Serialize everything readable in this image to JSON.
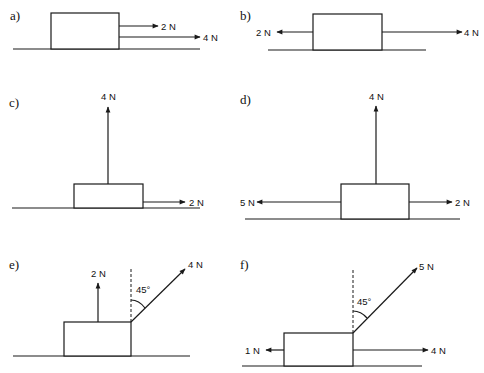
{
  "figure": {
    "panels": [
      {
        "label": "a)",
        "forces": [
          {
            "magnitude": "2 N",
            "direction": "right"
          },
          {
            "magnitude": "4 N",
            "direction": "right"
          }
        ]
      },
      {
        "label": "b)",
        "forces": [
          {
            "magnitude": "2 N",
            "direction": "left"
          },
          {
            "magnitude": "4 N",
            "direction": "right"
          }
        ]
      },
      {
        "label": "c)",
        "forces": [
          {
            "magnitude": "4 N",
            "direction": "up"
          },
          {
            "magnitude": "2 N",
            "direction": "right"
          }
        ]
      },
      {
        "label": "d)",
        "forces": [
          {
            "magnitude": "4 N",
            "direction": "up"
          },
          {
            "magnitude": "5 N",
            "direction": "left"
          },
          {
            "magnitude": "2 N",
            "direction": "right"
          }
        ]
      },
      {
        "label": "e)",
        "forces": [
          {
            "magnitude": "2 N",
            "direction": "up"
          },
          {
            "magnitude": "4 N",
            "direction": "45° from vertical, up-right"
          }
        ],
        "angle_label": "45°"
      },
      {
        "label": "f)",
        "forces": [
          {
            "magnitude": "5 N",
            "direction": "45° from vertical, up-right"
          },
          {
            "magnitude": "1 N",
            "direction": "left"
          },
          {
            "magnitude": "4 N",
            "direction": "right"
          }
        ],
        "angle_label": "45°"
      }
    ]
  }
}
